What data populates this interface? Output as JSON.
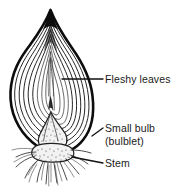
{
  "figure": {
    "subject": "bulb",
    "background_color": "#ffffff",
    "ink_color": "#0d0d0d",
    "width": 188,
    "height": 192
  },
  "labels": [
    {
      "id": "fleshy-leaves",
      "text": "Fleshy leaves",
      "x": 105,
      "y": 82,
      "leader": "horizontal line from bulb interior to label"
    },
    {
      "id": "small-bulb",
      "text": "Small bulb",
      "x": 105,
      "y": 131,
      "leader": "short diagonal line from bulb side to label"
    },
    {
      "id": "bulblet",
      "text": "(bulblet)",
      "x": 105,
      "y": 145,
      "leader": "none"
    },
    {
      "id": "stem",
      "text": "Stem",
      "x": 105,
      "y": 165,
      "leader": "diagonal line from basal plate to label"
    }
  ],
  "parts": {
    "fleshy_leaves": "concentric teardrop scale layers",
    "small_bulb": "bulblet at base of bulb",
    "stem": "basal plate with roots"
  }
}
